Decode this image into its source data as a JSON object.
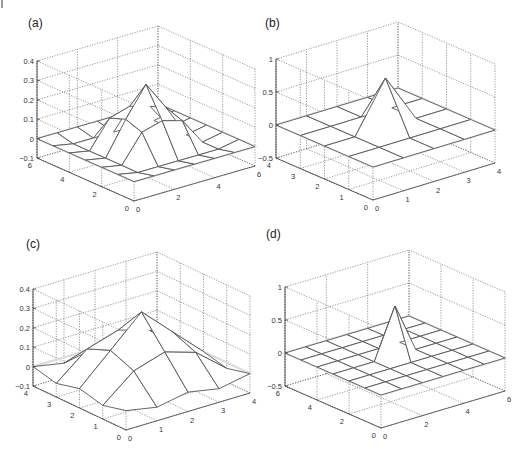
{
  "figure": {
    "corner_mark": "|",
    "panels": [
      {
        "id": "a",
        "label": "(a)"
      },
      {
        "id": "b",
        "label": "(b)"
      },
      {
        "id": "c",
        "label": "(c)"
      },
      {
        "id": "d",
        "label": "(d)"
      }
    ]
  },
  "chart_data": [
    {
      "panel": "(a)",
      "type": "surface_mesh",
      "title": "",
      "x_ticks": [
        0,
        2,
        4,
        6
      ],
      "y_ticks": [
        0,
        2,
        4,
        6
      ],
      "z_ticks": [
        -0.1,
        0,
        0.1,
        0.2,
        0.3,
        0.4
      ],
      "z_tick_labels": [
        "−0.1",
        "0",
        "0.1",
        "0.2",
        "0.3",
        "0.4"
      ],
      "xlim": [
        0,
        6
      ],
      "ylim": [
        0,
        6
      ],
      "zlim": [
        -0.1,
        0.4
      ],
      "grid": true,
      "description": "7x7 grid, pyramid-shaped kernel peaking ~0.3 at center (3,3), small negative ring around edges",
      "z": [
        [
          0,
          0,
          0,
          0,
          0,
          0,
          0
        ],
        [
          0,
          -0.02,
          -0.02,
          -0.02,
          -0.02,
          -0.02,
          0
        ],
        [
          0,
          -0.02,
          0.12,
          0.15,
          0.12,
          -0.02,
          0
        ],
        [
          0,
          -0.02,
          0.15,
          0.3,
          0.15,
          -0.02,
          0
        ],
        [
          0,
          -0.02,
          0.12,
          0.15,
          0.12,
          -0.02,
          0
        ],
        [
          0,
          -0.02,
          -0.02,
          -0.02,
          -0.02,
          -0.02,
          0
        ],
        [
          0,
          0,
          0,
          0,
          0,
          0,
          0
        ]
      ]
    },
    {
      "panel": "(b)",
      "type": "surface_mesh",
      "title": "",
      "x_ticks": [
        0,
        1,
        2,
        3,
        4
      ],
      "y_ticks": [
        0,
        1,
        2,
        3,
        4
      ],
      "z_ticks": [
        -0.5,
        0,
        0.5,
        1
      ],
      "z_tick_labels": [
        "−0.5",
        "0",
        "0.5",
        "1"
      ],
      "xlim": [
        0,
        4
      ],
      "ylim": [
        0,
        4
      ],
      "zlim": [
        -0.5,
        1
      ],
      "grid": true,
      "description": "5x5 grid, sharp spike ~0.75 at center (2,2), zero elsewhere",
      "z": [
        [
          0,
          0,
          0,
          0,
          0
        ],
        [
          0,
          0,
          0,
          0,
          0
        ],
        [
          0,
          0,
          0.75,
          0,
          0
        ],
        [
          0,
          0,
          0,
          0,
          0
        ],
        [
          0,
          0,
          0,
          0,
          0
        ]
      ]
    },
    {
      "panel": "(c)",
      "type": "surface_mesh",
      "title": "",
      "x_ticks": [
        0,
        1,
        2,
        3,
        4
      ],
      "y_ticks": [
        0,
        1,
        2,
        3,
        4
      ],
      "z_ticks": [
        -0.1,
        0,
        0.1,
        0.2,
        0.3,
        0.4
      ],
      "z_tick_labels": [
        "−0.1",
        "0",
        "0.1",
        "0.2",
        "0.3",
        "0.4"
      ],
      "xlim": [
        0,
        4
      ],
      "ylim": [
        0,
        4
      ],
      "zlim": [
        -0.1,
        0.4
      ],
      "grid": true,
      "description": "5x5 grid, broad pyramid peaking ~0.3 at center (2,2)",
      "z": [
        [
          0,
          -0.03,
          0,
          -0.03,
          0
        ],
        [
          -0.03,
          0.1,
          0.15,
          0.1,
          -0.03
        ],
        [
          0,
          0.15,
          0.3,
          0.15,
          0
        ],
        [
          -0.03,
          0.1,
          0.15,
          0.1,
          -0.03
        ],
        [
          0,
          -0.03,
          0,
          -0.03,
          0
        ]
      ]
    },
    {
      "panel": "(d)",
      "type": "surface_mesh",
      "title": "",
      "x_ticks": [
        0,
        2,
        4,
        6
      ],
      "y_ticks": [
        0,
        2,
        4,
        6
      ],
      "z_ticks": [
        -0.5,
        0,
        0.5,
        1
      ],
      "z_tick_labels": [
        "−0.5",
        "0",
        "0.5",
        "1"
      ],
      "xlim": [
        0,
        6
      ],
      "ylim": [
        0,
        6
      ],
      "zlim": [
        -0.5,
        1
      ],
      "grid": true,
      "description": "7x7 grid, narrow spike ~0.75 at center (3,3), zero elsewhere",
      "z": [
        [
          0,
          0,
          0,
          0,
          0,
          0,
          0
        ],
        [
          0,
          0,
          0,
          0,
          0,
          0,
          0
        ],
        [
          0,
          0,
          0,
          0,
          0,
          0,
          0
        ],
        [
          0,
          0,
          0,
          0.75,
          0,
          0,
          0
        ],
        [
          0,
          0,
          0,
          0,
          0,
          0,
          0
        ],
        [
          0,
          0,
          0,
          0,
          0,
          0,
          0
        ],
        [
          0,
          0,
          0,
          0,
          0,
          0,
          0
        ]
      ]
    }
  ]
}
